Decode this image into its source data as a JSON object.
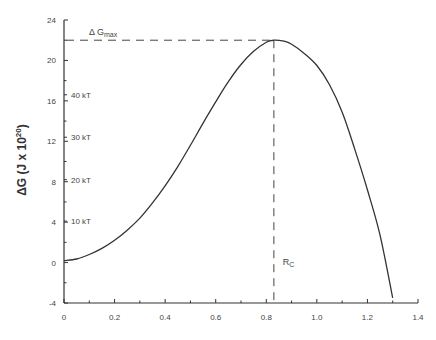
{
  "chart_data": {
    "type": "line",
    "title": "",
    "xlabel": "",
    "ylabel": "ΔG  (J x 10^20)",
    "ylabel_parts": {
      "main": "ΔG  (J x 10",
      "sup": "20",
      "end": ")"
    },
    "xlim": [
      0,
      1.4
    ],
    "ylim": [
      -4,
      24
    ],
    "grid": false,
    "legend": null,
    "x_ticks": [
      0,
      0.2,
      0.4,
      0.6,
      0.8,
      1.0,
      1.2,
      1.4
    ],
    "x_tick_labels": [
      "0",
      "0.2",
      "0.4",
      "0.6",
      "0.8",
      "1.0",
      "1.2",
      "1.4"
    ],
    "x_minor_ticks": [
      0.1,
      0.3,
      0.5,
      0.7,
      0.9,
      1.1,
      1.3
    ],
    "y_ticks": [
      -4,
      0,
      4,
      8,
      12,
      16,
      20,
      24
    ],
    "y_tick_labels": [
      "-4",
      "0",
      "4",
      "8",
      "12",
      "16",
      "20",
      "24"
    ],
    "y_minor_ticks": [
      -2,
      2,
      6,
      10,
      14,
      18,
      22
    ],
    "kT_labels": [
      {
        "label": "10 kT",
        "y": 4.1
      },
      {
        "label": "20 kT",
        "y": 8.2
      },
      {
        "label": "30 kT",
        "y": 12.4
      },
      {
        "label": "40 kT",
        "y": 16.6
      }
    ],
    "series": [
      {
        "name": "ΔG(R)",
        "x": [
          0,
          0.05,
          0.1,
          0.15,
          0.2,
          0.25,
          0.3,
          0.35,
          0.4,
          0.45,
          0.5,
          0.55,
          0.6,
          0.65,
          0.7,
          0.75,
          0.8,
          0.83,
          0.87,
          0.9,
          0.95,
          1.0,
          1.05,
          1.1,
          1.15,
          1.2,
          1.25,
          1.3
        ],
        "y": [
          0.2,
          0.35,
          0.8,
          1.4,
          2.2,
          3.2,
          4.4,
          5.9,
          7.6,
          9.5,
          11.6,
          13.8,
          15.9,
          17.9,
          19.6,
          20.9,
          21.8,
          22.0,
          21.9,
          21.6,
          20.7,
          19.5,
          17.6,
          14.9,
          11.2,
          7.2,
          2.7,
          -3.5
        ]
      }
    ],
    "annotations": [
      {
        "type": "hline-dashed",
        "label": "Δ G",
        "sub": "max",
        "y": 22.0,
        "x_from": 0,
        "x_to": 0.83
      },
      {
        "type": "vline-dashed",
        "label": "R",
        "sub": "C",
        "x": 0.83,
        "y_from": -4,
        "y_to": 22.0
      }
    ]
  }
}
